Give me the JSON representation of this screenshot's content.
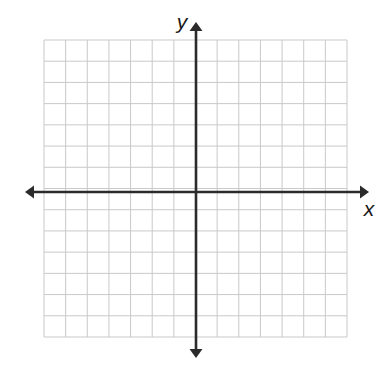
{
  "figure": {
    "kind": "coordinate-plane",
    "title": "",
    "background_color": "#ffffff"
  },
  "grid": {
    "columns": 14,
    "rows": 14,
    "left_px": 44,
    "top_px": 40,
    "right_px": 347,
    "bottom_px": 337,
    "cell_width_px": 21.64,
    "cell_height_px": 21.21,
    "line_color": "#c9c9c9",
    "line_width_px": 1,
    "visible": true
  },
  "axes": {
    "origin_x_px": 196,
    "origin_y_px": 192,
    "color": "#2b2b2b",
    "line_width_px": 2.6,
    "arrowheads": "both-ends",
    "x_axis": {
      "label": "x",
      "label_style": "italic",
      "start_px": 25,
      "end_px": 369,
      "label_x_px": 369,
      "label_y_px": 216,
      "units_left_of_origin": 7,
      "units_right_of_origin": 7
    },
    "y_axis": {
      "label": "y",
      "label_style": "italic",
      "start_px": 22,
      "end_px": 358,
      "label_x_px": 182,
      "label_y_px": 29,
      "units_above_origin": 7,
      "units_below_origin": 7
    }
  },
  "chart_data": {
    "type": "scatter",
    "title": "",
    "xlabel": "x",
    "ylabel": "y",
    "x": [],
    "y": [],
    "series": [],
    "xlim": [
      -7,
      7
    ],
    "ylim": [
      -7,
      7
    ],
    "xticks": [
      -7,
      -6,
      -5,
      -4,
      -3,
      -2,
      -1,
      0,
      1,
      2,
      3,
      4,
      5,
      6,
      7
    ],
    "yticks": [
      -7,
      -6,
      -5,
      -4,
      -3,
      -2,
      -1,
      0,
      1,
      2,
      3,
      4,
      5,
      6,
      7
    ],
    "xtick_labels": [],
    "ytick_labels": [],
    "grid": true,
    "legend": [],
    "legend_position": "none",
    "annotations": [],
    "note": "Empty coordinate grid; no data plotted."
  }
}
